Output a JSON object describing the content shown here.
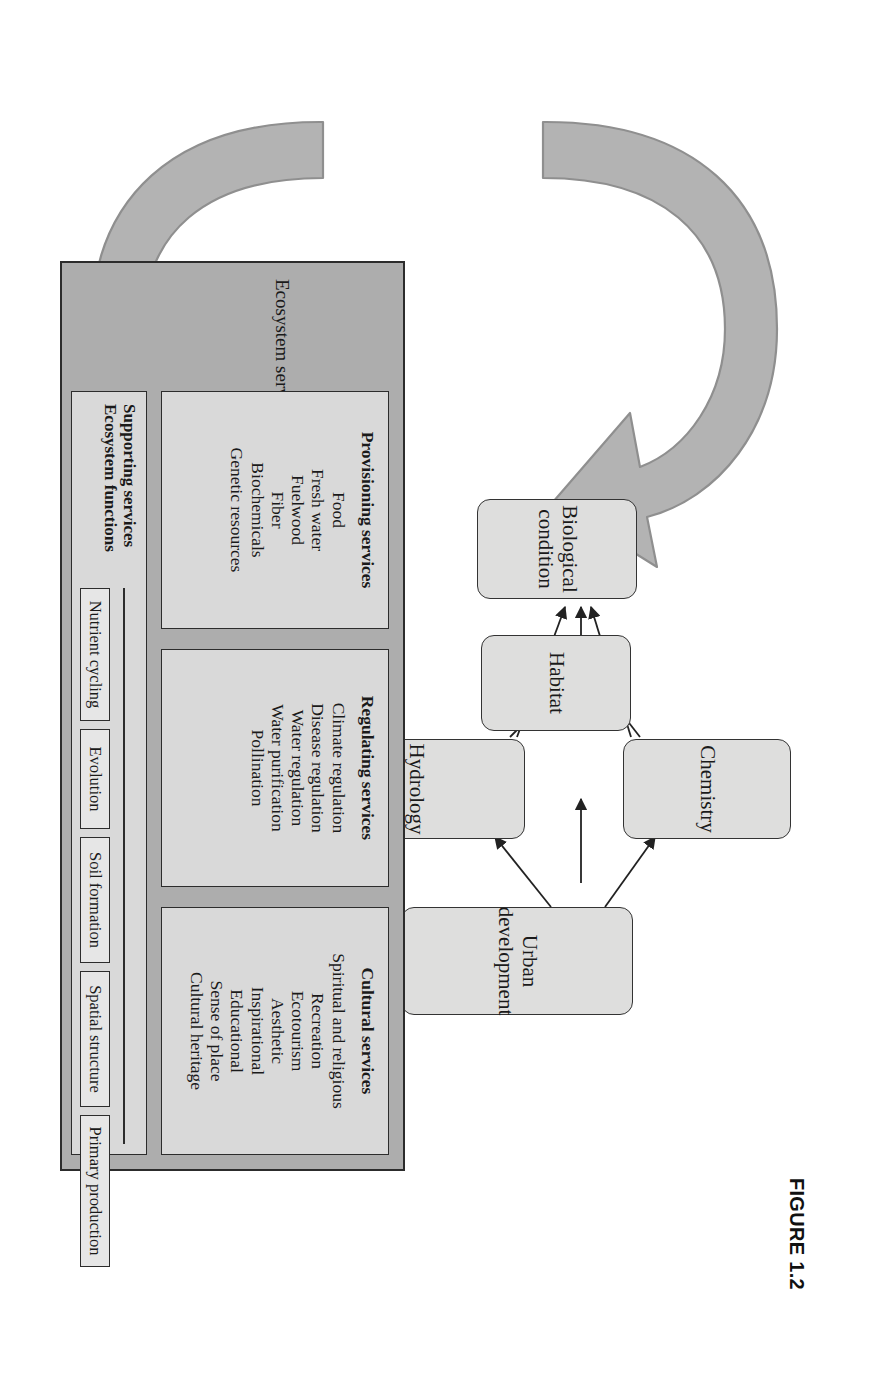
{
  "figure": {
    "caption": "FIGURE 1.2",
    "colors": {
      "node_fill": "#dededd",
      "node_stroke": "#333333",
      "panel_fill": "#adadad",
      "service_box_fill": "#d9d9d9",
      "function_box_fill": "#e6e6e6",
      "arrow_fill": "#b3b3b3",
      "arrow_stroke": "#8c8c8c"
    }
  },
  "drivers": {
    "nodes": [
      {
        "id": "urban-development",
        "label": "Urban\ndevelopment"
      },
      {
        "id": "chemistry",
        "label": "Chemistry"
      },
      {
        "id": "hydrology",
        "label": "Hydrology"
      },
      {
        "id": "habitat",
        "label": "Habitat"
      },
      {
        "id": "biological-condition",
        "label": "Biological\ncondition"
      }
    ],
    "links": [
      {
        "from": "urban-development",
        "to": "chemistry"
      },
      {
        "from": "urban-development",
        "to": "habitat"
      },
      {
        "from": "urban-development",
        "to": "hydrology"
      },
      {
        "from": "chemistry",
        "to": "habitat"
      },
      {
        "from": "chemistry",
        "to": "biological-condition"
      },
      {
        "from": "hydrology",
        "to": "habitat"
      },
      {
        "from": "hydrology",
        "to": "biological-condition"
      },
      {
        "from": "habitat",
        "to": "biological-condition"
      }
    ]
  },
  "panel": {
    "title": "Ecosystem services",
    "services": [
      {
        "id": "provisioning",
        "header": "Provisioning services",
        "items": [
          "Food",
          "Fresh water",
          "Fuelwood",
          "Fiber",
          "Biochemicals",
          "Genetic resources"
        ]
      },
      {
        "id": "regulating",
        "header": "Regulating services",
        "items": [
          "Climate regulation",
          "Disease regulation",
          "Water regulation",
          "Water purification",
          "Pollination"
        ]
      },
      {
        "id": "cultural",
        "header": "Cultural services",
        "items": [
          "Spiritual and religious",
          "Recreation",
          "Ecotourism",
          "Aesthetic",
          "Inspirational",
          "Educational",
          "Sense of place",
          "Cultural heritage"
        ]
      }
    ],
    "supporting": {
      "line1": "Supporting services",
      "line2": "Ecosystem functions",
      "functions": [
        "Nutrient cycling",
        "Evolution",
        "Soil formation",
        "Spatial structure",
        "Primary production"
      ]
    }
  }
}
